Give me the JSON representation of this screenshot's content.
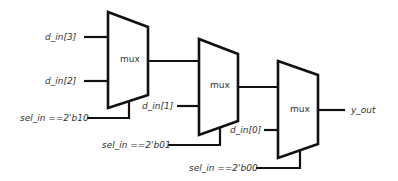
{
  "diagram": {
    "type": "mux-cascade",
    "muxes": [
      {
        "id": "mux1",
        "label": "mux"
      },
      {
        "id": "mux2",
        "label": "mux"
      },
      {
        "id": "mux3",
        "label": "mux"
      }
    ],
    "inputs": {
      "d_in3": "d_in[3]",
      "d_in2": "d_in[2]",
      "d_in1": "d_in[1]",
      "d_in0": "d_in[0]"
    },
    "selects": {
      "sel_b10": "sel_in ==2'b10",
      "sel_b01": "sel_in ==2'b01",
      "sel_b00": "sel_in ==2'b00"
    },
    "output": "y_out"
  }
}
